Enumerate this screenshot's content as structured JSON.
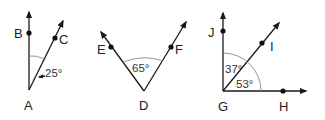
{
  "figures": [
    {
      "id": "angle-BAC",
      "vertex": {
        "label": "A",
        "x": 29,
        "y": 90
      },
      "points": [
        {
          "label": "B",
          "x": 29,
          "y": 33
        },
        {
          "label": "C",
          "x": 55,
          "y": 39
        }
      ],
      "angle_label": "25°"
    },
    {
      "id": "angle-EDF",
      "vertex": {
        "label": "D",
        "x": 144,
        "y": 91
      },
      "points": [
        {
          "label": "E",
          "x": 111,
          "y": 47
        },
        {
          "label": "F",
          "x": 171,
          "y": 47
        }
      ],
      "angle_label": "65°"
    },
    {
      "id": "angles-JGI-IGH",
      "vertex": {
        "label": "G",
        "x": 223,
        "y": 91
      },
      "points": [
        {
          "label": "J",
          "x": 223,
          "y": 31
        },
        {
          "label": "I",
          "x": 262,
          "y": 43
        },
        {
          "label": "H",
          "x": 283,
          "y": 91
        }
      ],
      "angle_labels": [
        "37°",
        "53°"
      ]
    }
  ],
  "colors": {
    "line": "#1a1a1a",
    "arc": "#8a8a8a",
    "text": "#222222"
  }
}
